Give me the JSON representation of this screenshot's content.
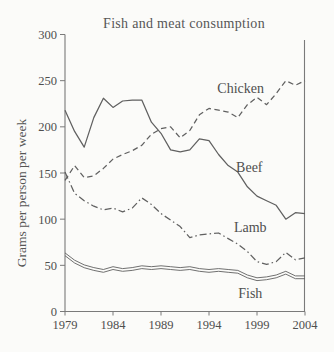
{
  "chart_data": {
    "type": "line",
    "title": "Fish and meat consumption",
    "ylabel": "Grams per person per week",
    "xlabel": "",
    "x_range": [
      1979,
      2004
    ],
    "y_range": [
      0,
      300
    ],
    "x_ticks": [
      1979,
      1984,
      1989,
      1994,
      1999,
      2004
    ],
    "y_ticks": [
      0,
      50,
      100,
      150,
      200,
      250,
      300
    ],
    "grid": false,
    "legend": "inline-labels",
    "line_color": "#606060",
    "axis_color": "#7a7a7a",
    "text_color": "#4f4f4f",
    "x": [
      1979,
      1980,
      1981,
      1982,
      1983,
      1984,
      1985,
      1986,
      1987,
      1988,
      1989,
      1990,
      1991,
      1992,
      1993,
      1994,
      1995,
      1996,
      1997,
      1998,
      1999,
      2000,
      2001,
      2002,
      2003,
      2004
    ],
    "series": [
      {
        "name": "Chicken",
        "style": "dashed",
        "values": [
          142,
          158,
          145,
          147,
          155,
          165,
          170,
          174,
          180,
          192,
          198,
          200,
          188,
          196,
          213,
          220,
          218,
          216,
          210,
          224,
          232,
          224,
          236,
          250,
          245,
          250
        ],
        "label_at": {
          "x": 1997.3,
          "y": 242
        }
      },
      {
        "name": "Beef",
        "style": "solid",
        "values": [
          218,
          195,
          178,
          210,
          231,
          221,
          228,
          229,
          229,
          205,
          193,
          175,
          173,
          175,
          187,
          185,
          170,
          158,
          151,
          135,
          125,
          120,
          115,
          100,
          107,
          106
        ],
        "label_at": {
          "x": 1998.2,
          "y": 156
        }
      },
      {
        "name": "Lamb",
        "style": "dashdot",
        "values": [
          151,
          128,
          120,
          114,
          110,
          112,
          108,
          112,
          123,
          116,
          106,
          99,
          92,
          80,
          83,
          84,
          85,
          79,
          73,
          65,
          54,
          51,
          54,
          64,
          56,
          58
        ],
        "label_at": {
          "x": 1998.3,
          "y": 91
        }
      },
      {
        "name": "Fish",
        "style": "double",
        "values": [
          62,
          54,
          49,
          46,
          44,
          47,
          45,
          46,
          48,
          47,
          48,
          47,
          46,
          47,
          45,
          44,
          45,
          44,
          43,
          38,
          35,
          36,
          38,
          42,
          37,
          37
        ],
        "label_at": {
          "x": 1998.3,
          "y": 19
        }
      }
    ]
  }
}
